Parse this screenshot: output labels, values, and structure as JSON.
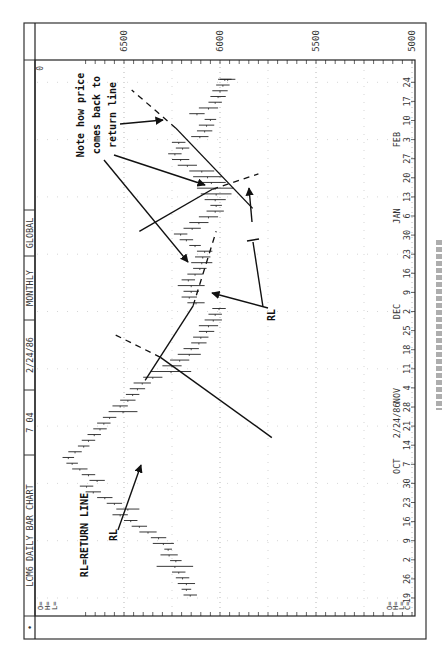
{
  "header": {
    "cells": [
      "•",
      "LCM6 DAILY BAR CHART",
      "7 04",
      "2/24/86",
      "MONTHLY",
      "GLOBAL",
      ""
    ],
    "corner_value": "0"
  },
  "ohlc_labels_left": [
    "O=",
    "H=",
    "L="
  ],
  "ohlc_labels_bottom": [
    "O=",
    "H=",
    "L=",
    "C="
  ],
  "annotations": {
    "legend": "RL=RETURN LINE",
    "rl_label_1": "RL",
    "rl_label_2": "RL",
    "note_lines": [
      "Note how price",
      "comes back to",
      "return line"
    ]
  },
  "chart_data": {
    "type": "bar",
    "subtype": "ohlc-daily",
    "title": "LCM6 DAILY BAR CHART",
    "orientation": "rotated 90° counter-clockwise (time runs bottom→top, price increases right→left)",
    "xlabel": "",
    "ylabel": "",
    "ylim": [
      5000,
      6500
    ],
    "y_ticks": [
      6500,
      6000,
      5500,
      5000
    ],
    "grid": "dotted",
    "x_month_labels": [
      {
        "label": "2/24/86",
        "at": 9
      },
      {
        "label": "OCT",
        "at": 7
      },
      {
        "label": "NOV",
        "at": 11
      },
      {
        "label": "DEC",
        "at": 2
      },
      {
        "label": "JAN",
        "at": 6
      },
      {
        "label": "FEB",
        "at": 3
      }
    ],
    "x_ticks": [
      "19",
      "26",
      "2",
      "9",
      "16",
      "23",
      "30",
      "7",
      "14",
      "21",
      "28",
      "4",
      "11",
      "18",
      "25",
      "2",
      "9",
      "16",
      "23",
      "30",
      "6",
      "13",
      "20",
      "27",
      "3",
      "10",
      "17",
      "24"
    ],
    "bars": [
      {
        "w": 0,
        "high": 6190,
        "low": 6120
      },
      {
        "w": 0.3,
        "high": 6200,
        "low": 6150
      },
      {
        "w": 0.6,
        "high": 6220,
        "low": 6130
      },
      {
        "w": 0.9,
        "high": 6230,
        "low": 6160
      },
      {
        "w": 1.2,
        "high": 6250,
        "low": 6180
      },
      {
        "w": 1.5,
        "high": 6330,
        "low": 6140
      },
      {
        "w": 1.8,
        "high": 6260,
        "low": 6200
      },
      {
        "w": 2.1,
        "high": 6310,
        "low": 6220
      },
      {
        "w": 2.4,
        "high": 6290,
        "low": 6250
      },
      {
        "w": 2.7,
        "high": 6350,
        "low": 6240
      },
      {
        "w": 3.0,
        "high": 6360,
        "low": 6280
      },
      {
        "w": 3.3,
        "high": 6420,
        "low": 6330
      },
      {
        "w": 3.6,
        "high": 6460,
        "low": 6380
      },
      {
        "w": 3.9,
        "high": 6500,
        "low": 6430
      },
      {
        "w": 4.2,
        "high": 6560,
        "low": 6480
      },
      {
        "w": 4.5,
        "high": 6540,
        "low": 6420
      },
      {
        "w": 4.8,
        "high": 6590,
        "low": 6510
      },
      {
        "w": 5.1,
        "high": 6640,
        "low": 6560
      },
      {
        "w": 5.4,
        "high": 6700,
        "low": 6620
      },
      {
        "w": 5.7,
        "high": 6730,
        "low": 6660
      },
      {
        "w": 6.0,
        "high": 6680,
        "low": 6600
      },
      {
        "w": 6.3,
        "high": 6720,
        "low": 6650
      },
      {
        "w": 6.6,
        "high": 6770,
        "low": 6690
      },
      {
        "w": 6.9,
        "high": 6800,
        "low": 6740
      },
      {
        "w": 7.2,
        "high": 6820,
        "low": 6760
      },
      {
        "w": 7.5,
        "high": 6790,
        "low": 6720
      },
      {
        "w": 7.8,
        "high": 6740,
        "low": 6680
      },
      {
        "w": 8.1,
        "high": 6720,
        "low": 6650
      },
      {
        "w": 8.4,
        "high": 6690,
        "low": 6620
      },
      {
        "w": 8.7,
        "high": 6660,
        "low": 6590
      },
      {
        "w": 9.0,
        "high": 6640,
        "low": 6570
      },
      {
        "w": 9.3,
        "high": 6610,
        "low": 6540
      },
      {
        "w": 9.6,
        "high": 6580,
        "low": 6430
      },
      {
        "w": 9.9,
        "high": 6560,
        "low": 6480
      },
      {
        "w": 10.2,
        "high": 6520,
        "low": 6440
      },
      {
        "w": 10.5,
        "high": 6490,
        "low": 6420
      },
      {
        "w": 10.8,
        "high": 6470,
        "low": 6390
      },
      {
        "w": 11.1,
        "high": 6450,
        "low": 6360
      },
      {
        "w": 11.4,
        "high": 6400,
        "low": 6300
      },
      {
        "w": 11.7,
        "high": 6360,
        "low": 6150
      },
      {
        "w": 12.0,
        "high": 6300,
        "low": 6200
      },
      {
        "w": 12.3,
        "high": 6260,
        "low": 6160
      },
      {
        "w": 12.6,
        "high": 6220,
        "low": 6100
      },
      {
        "w": 12.9,
        "high": 6190,
        "low": 6110
      },
      {
        "w": 13.2,
        "high": 6150,
        "low": 6070
      },
      {
        "w": 13.5,
        "high": 6140,
        "low": 6060
      },
      {
        "w": 13.8,
        "high": 6110,
        "low": 6030
      },
      {
        "w": 14.1,
        "high": 6110,
        "low": 6010
      },
      {
        "w": 14.4,
        "high": 6080,
        "low": 5990
      },
      {
        "w": 14.7,
        "high": 6060,
        "low": 5990
      },
      {
        "w": 15.0,
        "high": 6040,
        "low": 5970
      },
      {
        "w": 15.3,
        "high": 6170,
        "low": 6080
      },
      {
        "w": 15.6,
        "high": 6200,
        "low": 6120
      },
      {
        "w": 15.9,
        "high": 6190,
        "low": 6110
      },
      {
        "w": 16.2,
        "high": 6220,
        "low": 6080
      },
      {
        "w": 16.5,
        "high": 6200,
        "low": 6130
      },
      {
        "w": 16.8,
        "high": 6170,
        "low": 6090
      },
      {
        "w": 17.1,
        "high": 6140,
        "low": 6070
      },
      {
        "w": 17.4,
        "high": 6150,
        "low": 6040
      },
      {
        "w": 17.7,
        "high": 6130,
        "low": 6050
      },
      {
        "w": 18.0,
        "high": 6120,
        "low": 6040
      },
      {
        "w": 18.3,
        "high": 6160,
        "low": 6100
      },
      {
        "w": 18.6,
        "high": 6210,
        "low": 6140
      },
      {
        "w": 18.9,
        "high": 6240,
        "low": 6170
      },
      {
        "w": 19.2,
        "high": 6190,
        "low": 6100
      },
      {
        "w": 19.5,
        "high": 6160,
        "low": 6060
      },
      {
        "w": 19.8,
        "high": 6110,
        "low": 6010
      },
      {
        "w": 20.1,
        "high": 6070,
        "low": 5980
      },
      {
        "w": 20.4,
        "high": 6050,
        "low": 5990
      },
      {
        "w": 20.7,
        "high": 6080,
        "low": 5970
      },
      {
        "w": 21.0,
        "high": 6100,
        "low": 5940
      },
      {
        "w": 21.3,
        "high": 6120,
        "low": 5930
      },
      {
        "w": 21.6,
        "high": 6120,
        "low": 5970
      },
      {
        "w": 21.9,
        "high": 6140,
        "low": 5990
      },
      {
        "w": 22.2,
        "high": 6160,
        "low": 6030
      },
      {
        "w": 22.5,
        "high": 6220,
        "low": 6120
      },
      {
        "w": 22.8,
        "high": 6250,
        "low": 6160
      },
      {
        "w": 23.1,
        "high": 6270,
        "low": 6200
      },
      {
        "w": 23.4,
        "high": 6230,
        "low": 6160
      },
      {
        "w": 23.7,
        "high": 6250,
        "low": 6180
      },
      {
        "w": 24.0,
        "high": 6150,
        "low": 6060
      },
      {
        "w": 24.3,
        "high": 6120,
        "low": 6040
      },
      {
        "w": 24.6,
        "high": 6110,
        "low": 6030
      },
      {
        "w": 24.9,
        "high": 6080,
        "low": 6020
      },
      {
        "w": 25.2,
        "high": 6160,
        "low": 6080
      },
      {
        "w": 25.5,
        "high": 6110,
        "low": 6010
      },
      {
        "w": 25.8,
        "high": 6060,
        "low": 5990
      },
      {
        "w": 26.1,
        "high": 6050,
        "low": 5970
      },
      {
        "w": 26.4,
        "high": 6040,
        "low": 5960
      },
      {
        "w": 26.7,
        "high": 6020,
        "low": 5950
      },
      {
        "w": 27.0,
        "high": 6010,
        "low": 5940
      },
      {
        "w": 27.0,
        "high": 6000,
        "low": 5920
      }
    ],
    "trendlines": [
      {
        "kind": "return-line",
        "from": {
          "w": 8.4,
          "price": 5730
        },
        "to": {
          "w": 12.6,
          "price": 6310
        },
        "dashed_extension_to": {
          "w": 13.8,
          "price": 6550
        }
      },
      {
        "kind": "trendline",
        "from": {
          "w": 11.4,
          "price": 6390
        },
        "to": {
          "w": 15.3,
          "price": 6140
        },
        "dashed_extension_to": {
          "w": 19.2,
          "price": 6020
        }
      },
      {
        "kind": "return-line",
        "from": {
          "w": 19.2,
          "price": 6420
        },
        "to": {
          "w": 21.4,
          "price": 6040
        },
        "dashed_extension_to": {
          "w": 22.2,
          "price": 5800
        }
      },
      {
        "kind": "trendline",
        "from": {
          "w": 20.4,
          "price": 5830
        },
        "to": {
          "w": 24.6,
          "price": 6230
        },
        "dashed_extension_to": {
          "w": 26.6,
          "price": 6460
        }
      }
    ]
  }
}
